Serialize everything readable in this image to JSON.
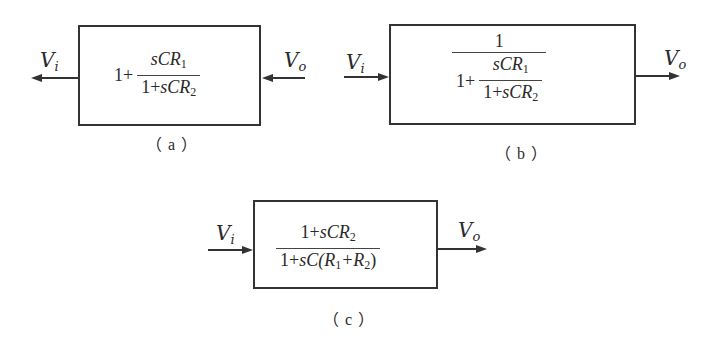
{
  "diagrams": [
    {
      "id": "a",
      "caption": "（a）",
      "input_label": "V",
      "input_sub": "i",
      "output_label": "V",
      "output_sub": "o",
      "signal_flow": "right-to-left",
      "transfer_function": "1 + sCR1 / (1 + sCR2)",
      "expr": {
        "lead": "1+",
        "num": {
          "s": "sCR",
          "sub": "1"
        },
        "den": {
          "pre": "1+",
          "s": "sCR",
          "sub": "2"
        }
      }
    },
    {
      "id": "b",
      "caption": "（b）",
      "input_label": "V",
      "input_sub": "i",
      "output_label": "V",
      "output_sub": "o",
      "signal_flow": "left-to-right",
      "transfer_function": "1 / (1 + sCR1 / (1 + sCR2))",
      "expr": {
        "num": "1",
        "den_lead": "1+",
        "inner_num": {
          "s": "sCR",
          "sub": "1"
        },
        "inner_den": {
          "pre": "1+",
          "s": "sCR",
          "sub": "2"
        }
      }
    },
    {
      "id": "c",
      "caption": "（c）",
      "input_label": "V",
      "input_sub": "i",
      "output_label": "V",
      "output_sub": "o",
      "signal_flow": "left-to-right",
      "transfer_function": "(1 + sCR2) / (1 + sC(R1 + R2))",
      "expr": {
        "num": {
          "pre": "1+",
          "s": "sCR",
          "sub": "2"
        },
        "den": {
          "pre": "1+",
          "s": "sC(R",
          "sub1": "1",
          "mid": "+R",
          "sub2": "2",
          "post": ")"
        }
      }
    }
  ]
}
